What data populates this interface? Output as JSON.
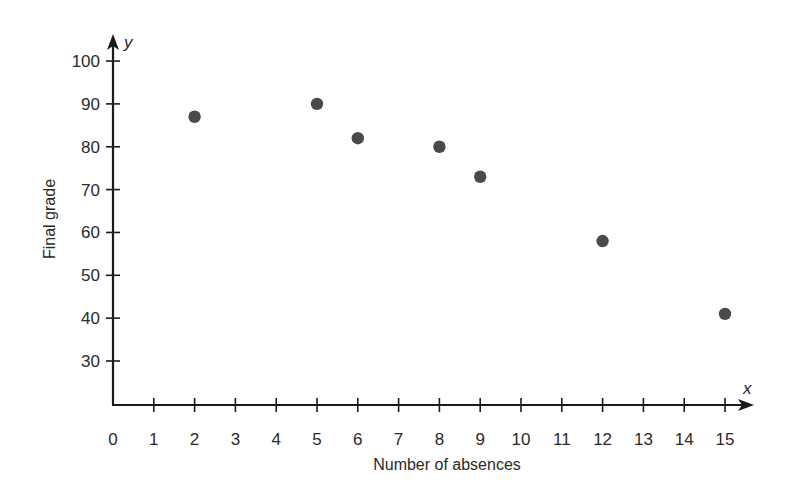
{
  "chart_data": {
    "type": "scatter",
    "title": "",
    "xlabel": "Number of absences",
    "ylabel": "Final grade",
    "x_axis_var": "x",
    "y_axis_var": "y",
    "xlim": [
      0,
      15
    ],
    "ylim": [
      20,
      100
    ],
    "x_ticks": [
      0,
      1,
      2,
      3,
      4,
      5,
      6,
      7,
      8,
      9,
      10,
      11,
      12,
      13,
      14,
      15
    ],
    "y_ticks": [
      30,
      40,
      50,
      60,
      70,
      80,
      90,
      100
    ],
    "grid": false,
    "legend": null,
    "points": [
      {
        "x": 2,
        "y": 87
      },
      {
        "x": 5,
        "y": 90
      },
      {
        "x": 6,
        "y": 82
      },
      {
        "x": 8,
        "y": 80
      },
      {
        "x": 9,
        "y": 73
      },
      {
        "x": 12,
        "y": 58
      },
      {
        "x": 15,
        "y": 41
      }
    ],
    "colors": {
      "axis": "#1a1a1a",
      "point": "#4a4a4a",
      "text": "#2a2a2a"
    }
  }
}
